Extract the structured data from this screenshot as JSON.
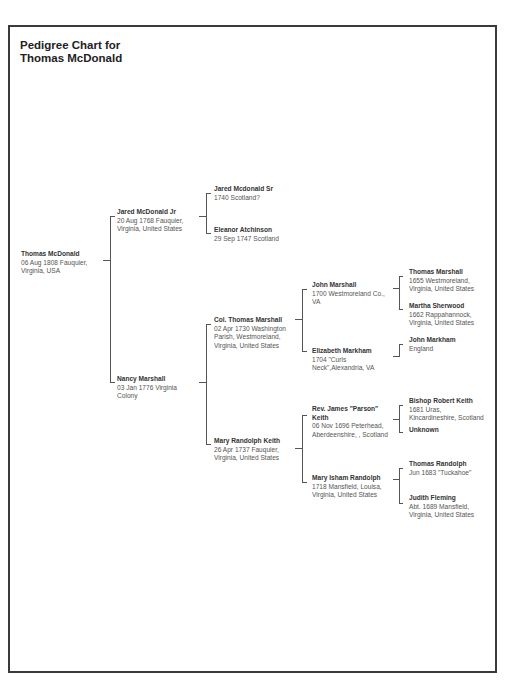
{
  "chart": {
    "title_line1": "Pedigree Chart for",
    "title_line2": "Thomas McDonald"
  },
  "people": {
    "root": {
      "name": "Thomas McDonald",
      "line1": "06 Aug 1808 Fauquier,",
      "line2": "Virginia, USA"
    },
    "father": {
      "name": "Jared McDonald Jr",
      "line1": "20 Aug 1768 Fauquier,",
      "line2": "Virginia, United States"
    },
    "mother": {
      "name": "Nancy Marshall",
      "line1": "03 Jan 1776 Virginia",
      "line2": "Colony"
    },
    "pat_grandfather": {
      "name": "Jared Mcdonald Sr",
      "line1": "1740 Scotland?"
    },
    "pat_grandmother": {
      "name": "Eleanor Atchinson",
      "line1": "29 Sep 1747 Scotland"
    },
    "mat_grandfather": {
      "name": "Col. Thomas Marshall",
      "line1": "02 Apr 1730 Washington",
      "line2": "Parish, Westmoreland,",
      "line3": "Virginia, United States"
    },
    "mat_grandmother": {
      "name": "Mary Randolph Keith",
      "line1": "26 Apr 1737 Fauquier,",
      "line2": "Virginia, United States"
    },
    "ggf_marshall": {
      "name": "John Marshall",
      "line1": "1700 Westmoreland Co.,",
      "line2": "VA"
    },
    "ggm_markham": {
      "name": "Elizabeth Markham",
      "line1": "1704 \"Curls",
      "line2": "Neck\",Alexandria, VA"
    },
    "ggf_keith": {
      "name": "Rev. James \"Parson\"",
      "name2": "Keith",
      "line1": "06 Nov 1696 Peterhead,",
      "line2": "Aberdeenshire, , Scotland"
    },
    "ggm_randolph": {
      "name": "Mary Isham Randolph",
      "line1": "1718 Mansfield, Louisa,",
      "line2": "Virginia, United States"
    },
    "gggf_thomas_marshall": {
      "name": "Thomas Marshall",
      "line1": "1655 Westmoreland,",
      "line2": "Virginia, United States"
    },
    "gggm_martha_sherwood": {
      "name": "Martha Sherwood",
      "line1": "1662 Rappahannock,",
      "line2": "Virginia, United States"
    },
    "gggf_john_markham": {
      "name": "John Markham",
      "line1": "England"
    },
    "gggf_robert_keith": {
      "name": "Bishop Robert Keith",
      "line1": "1681 Uras,",
      "line2": "Kincardineshire, Scotland"
    },
    "gggm_unknown": {
      "name": "Unknown"
    },
    "gggf_thomas_randolph": {
      "name": "Thomas Randolph",
      "line1": "Jun 1683 \"Tuckahoe\""
    },
    "gggm_judith_fleming": {
      "name": "Judith Fleming",
      "line1": "Abt. 1689 Mansfield,",
      "line2": "Virginia, United States"
    }
  }
}
